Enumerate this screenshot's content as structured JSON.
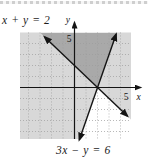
{
  "figure": {
    "eq1_label": "x + y = 2",
    "eq2_label": "3x − y = 6",
    "x_axis_label": "x",
    "y_axis_label": "y",
    "x_tick": "5",
    "y_tick": "5"
  },
  "colors": {
    "light_shade": "#d8d8d8",
    "dark_shade": "#a9a9a9",
    "grid": "#9c9c9c",
    "line": "#141414",
    "background": "#ffffff"
  },
  "chart_data": {
    "type": "line",
    "title": "",
    "xlabel": "x",
    "ylabel": "y",
    "xlim": [
      -4.7,
      4.9
    ],
    "ylim": [
      -4.7,
      5.0
    ],
    "x_ticks_labeled": [
      5
    ],
    "y_ticks_labeled": [
      5
    ],
    "grid": "dotted",
    "grid_range": [
      -4,
      4
    ],
    "lines": [
      {
        "equation": "x + y = 2",
        "slope": -1,
        "y_intercept": 2,
        "x_intercept": 2,
        "style": "solid-with-arrows",
        "endpoints": [
          [
            -2.6,
            4.6
          ],
          [
            4.6,
            -2.6
          ]
        ]
      },
      {
        "equation": "3x − y = 6",
        "slope": 3,
        "y_intercept": -6,
        "x_intercept": 2,
        "style": "solid-with-arrows",
        "endpoints": [
          [
            3.62,
            4.85
          ],
          [
            0.42,
            -4.75
          ]
        ]
      }
    ],
    "intersection_point": [
      2,
      0
    ],
    "shading": {
      "dark_region_meaning": "overlap of half-planes x + y ≥ 2 and 3x − y ≤ 6",
      "dark_polygon": [
        [
          -2.95,
          4.95
        ],
        [
          3.67,
          4.95
        ],
        [
          2,
          0
        ]
      ],
      "white_region_meaning": "region satisfying neither inequality",
      "white_polygon": [
        [
          2,
          0
        ],
        [
          0.44,
          -4.72
        ],
        [
          4.95,
          -4.72
        ],
        [
          4.95,
          -2.95
        ]
      ],
      "light_region_meaning": "points satisfying exactly one inequality"
    }
  }
}
